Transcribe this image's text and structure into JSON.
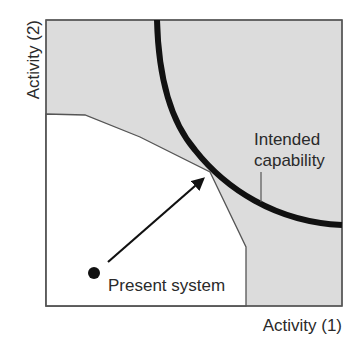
{
  "diagram": {
    "axes": {
      "x_label": "Activity (1)",
      "y_label": "Activity (2)"
    },
    "regions": {
      "outer_fill_color": "#dcdcdc",
      "present_capability_fill_color": "#ffffff"
    },
    "curve": {
      "label_line1": "Intended",
      "label_line2": "capability",
      "color": "#111111"
    },
    "point": {
      "label": "Present system",
      "color": "#111111"
    }
  }
}
